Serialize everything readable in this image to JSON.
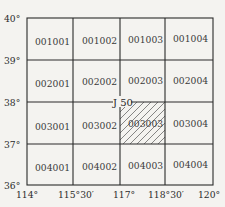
{
  "diagram": {
    "sheet_label": "J 50",
    "lat_labels": [
      "40°",
      "39°",
      "38°",
      "37°",
      "36°"
    ],
    "lon_labels": [
      "114°",
      "115°30′",
      "117°",
      "118°30′",
      "120°"
    ],
    "cells": [
      [
        "001001",
        "001002",
        "001003",
        "001004"
      ],
      [
        "002001",
        "002002",
        "002003",
        "002004"
      ],
      [
        "003001",
        "003002",
        "003003",
        "003004"
      ],
      [
        "004001",
        "004002",
        "004003",
        "004004"
      ]
    ],
    "highlighted_cell": "003003",
    "highlight_style": "diagonal-hatch"
  }
}
